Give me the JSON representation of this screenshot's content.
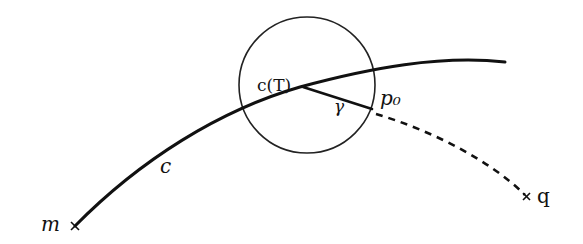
{
  "diagram": {
    "colors": {
      "ink": "#111111",
      "background": "#ffffff"
    },
    "labels": {
      "curve": "c",
      "curve_point": "c(T)",
      "segment": "γ",
      "point_p0": "p₀",
      "start_point": "m",
      "end_point": "q"
    },
    "elements": {
      "circle": {
        "cx": 307,
        "cy": 85,
        "r": 68
      },
      "curve_c": {
        "from": "m",
        "to": "end",
        "style": "solid"
      },
      "segment_gamma": {
        "from": "c(T)",
        "to": "p₀",
        "style": "solid"
      },
      "path_to_q": {
        "from": "p₀",
        "to": "q",
        "style": "dashed"
      }
    }
  }
}
